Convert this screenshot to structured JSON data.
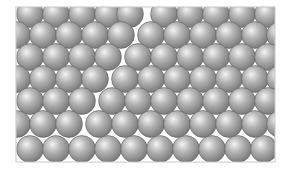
{
  "diagram": {
    "frame": {
      "x": 16,
      "y": 7,
      "width": 259,
      "height": 155,
      "stroke": "#c8c8c8",
      "background": "#ffffff"
    },
    "sphere": {
      "radius": 13.4,
      "highlight": "#f4f4f4",
      "mid": "#b4b4b4",
      "shadow": "#7a7a7a",
      "outline": "#5e5e5e"
    },
    "rows": [
      {
        "y": 14,
        "left": [
          30,
          56,
          82,
          108,
          130
        ],
        "right": [
          164,
          190,
          216,
          242,
          268
        ]
      },
      {
        "y": 35,
        "left": [
          17,
          43,
          69,
          95,
          121
        ],
        "right": [
          151,
          177,
          203,
          229,
          255,
          280
        ]
      },
      {
        "y": 57,
        "left": [
          30,
          56,
          82,
          108
        ],
        "right": [
          138,
          164,
          190,
          216,
          242,
          268
        ]
      },
      {
        "y": 79,
        "left": [
          17,
          43,
          69,
          95
        ],
        "right": [
          125,
          151,
          177,
          203,
          229,
          255,
          280
        ]
      },
      {
        "y": 101,
        "left": [
          30,
          56,
          82
        ],
        "right": [
          112,
          138,
          164,
          190,
          216,
          242,
          268
        ]
      },
      {
        "y": 124,
        "left": [
          17,
          43,
          69
        ],
        "right": [
          99,
          125,
          151,
          177,
          203,
          229,
          255,
          280
        ]
      },
      {
        "y": 149,
        "left": [
          30,
          56,
          82
        ],
        "right": [
          108,
          134,
          160,
          186,
          212,
          238,
          264
        ]
      }
    ]
  }
}
